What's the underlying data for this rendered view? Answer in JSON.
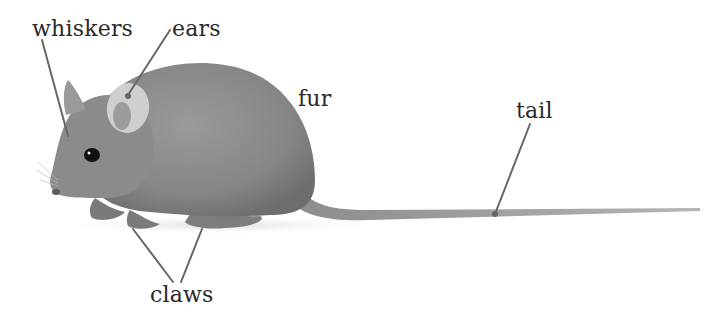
{
  "diagram": {
    "labels": {
      "whiskers": "whiskers",
      "ears": "ears",
      "fur": "fur",
      "tail": "tail",
      "claws": "claws"
    },
    "colors": {
      "background": "#ffffff",
      "label_text": "#2a2a2a",
      "leader_line": "#666666",
      "body": "#8a8a8a",
      "body_dark": "#6f6f6f",
      "ear_inner": "#c9c9c9",
      "eye": "#111111"
    }
  }
}
